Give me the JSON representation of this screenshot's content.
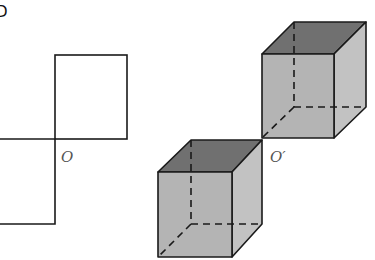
{
  "figure": {
    "corner_label": "D",
    "left_label": "O",
    "right_label": "O′",
    "colors": {
      "line": "#1a1a1a",
      "top_face": "#707070",
      "front_face": "#b4b4b4",
      "side_face": "#c2c2c2"
    }
  }
}
